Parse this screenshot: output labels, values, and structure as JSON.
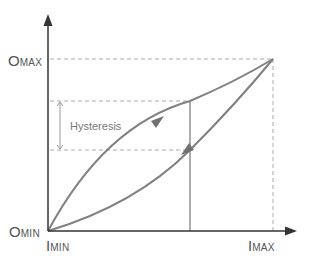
{
  "diagram": {
    "labels": {
      "omax_big": "O",
      "omax_small": "MAX",
      "omin_big": "O",
      "omin_small": "MIN",
      "imin_big": "I",
      "imin_small": "MIN",
      "imax_big": "I",
      "imax_small": "MAX",
      "hysteresis": "Hysteresis"
    },
    "colors": {
      "axis": "#333333",
      "curve": "#808080",
      "dashed": "#aaaaaa",
      "text": "#555555"
    }
  }
}
